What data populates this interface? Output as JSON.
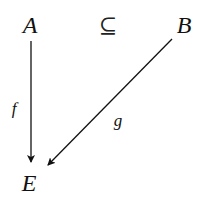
{
  "diagram": {
    "type": "commutative-diagram",
    "nodes": {
      "A": {
        "label": "A",
        "x": 30,
        "y": 25
      },
      "B": {
        "label": "B",
        "x": 184,
        "y": 25
      },
      "E": {
        "label": "E",
        "x": 29,
        "y": 183
      }
    },
    "relation": {
      "symbol": "⊆",
      "between": [
        "A",
        "B"
      ],
      "x": 108,
      "y": 26
    },
    "arrows": [
      {
        "id": "f",
        "from": "A",
        "to": "E",
        "label": "f",
        "label_x": 14,
        "label_y": 108
      },
      {
        "id": "g",
        "from": "B",
        "to": "E",
        "label": "g",
        "label_x": 118,
        "label_y": 120
      }
    ],
    "stroke_color": "#111111"
  }
}
